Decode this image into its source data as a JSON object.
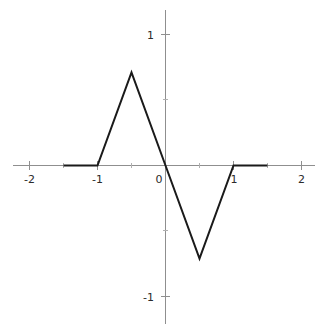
{
  "chart_data": {
    "type": "line",
    "title": "",
    "xlabel": "",
    "ylabel": "",
    "xlim": [
      -2.2,
      2.2
    ],
    "ylim": [
      -1.25,
      1.25
    ],
    "grid": false,
    "legend": null,
    "axis_style": "centered-spines",
    "line_color": "#1a1a1a",
    "axis_color": "#8f8f8f",
    "tick_color": "#8f8f8f",
    "line_width": 2.0,
    "series": [
      {
        "name": "piecewise-linear-odd-function",
        "x": [
          -1.5,
          -1.0,
          -0.5,
          0.0,
          0.5,
          1.0,
          1.5
        ],
        "y": [
          0.0,
          0.0,
          0.71,
          0.0,
          -0.71,
          0.0,
          0.0
        ]
      }
    ],
    "x_ticks": [
      -2,
      -1.5,
      -1,
      -0.5,
      0,
      0.5,
      1,
      1.5,
      2
    ],
    "x_tick_labels": [
      "-2",
      "",
      "-1",
      "",
      "0",
      "",
      "1",
      "",
      "2"
    ],
    "y_ticks": [
      -1,
      -0.5,
      0,
      0.5,
      1
    ],
    "y_tick_labels": [
      "-1",
      "",
      "",
      "",
      "1"
    ],
    "annotations": []
  },
  "labels": {
    "x_neg2": "-2",
    "x_neg1": "-1",
    "x_zero": "0",
    "x_pos1": "1",
    "x_pos2": "2",
    "y_pos1": "1",
    "y_neg1": "-1"
  }
}
